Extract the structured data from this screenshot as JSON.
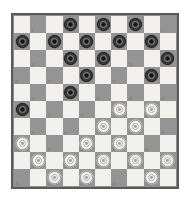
{
  "app": {
    "title": "Draughts Board",
    "board_type": "international-draughts-10x10"
  },
  "board": {
    "rows": 10,
    "columns": 10,
    "light_square_color": "#f2f1ed",
    "dark_square_color": "#949494",
    "border_color": "#5a5a5a",
    "background_color": "#ffffff",
    "dark_piece_color": "#3b3b3b",
    "light_piece_color": "#f7f6f2",
    "piece_style": "concentric-rings",
    "dark_piece_count": 15,
    "light_piece_count": 15,
    "square_numbering": "playable-dark-squares-1-to-50",
    "numbering_visible": true
  },
  "chart_data": {
    "type": "table",
    "squares": [
      [
        {
          "shade": "light",
          "piece": null,
          "num": null
        },
        {
          "shade": "dark",
          "piece": null,
          "num": "1"
        },
        {
          "shade": "light",
          "piece": null,
          "num": null
        },
        {
          "shade": "dark",
          "piece": "dark",
          "num": "2"
        },
        {
          "shade": "light",
          "piece": null,
          "num": null
        },
        {
          "shade": "dark",
          "piece": "dark",
          "num": "3"
        },
        {
          "shade": "light",
          "piece": null,
          "num": null
        },
        {
          "shade": "dark",
          "piece": "dark",
          "num": "4"
        },
        {
          "shade": "light",
          "piece": null,
          "num": null
        },
        {
          "shade": "dark",
          "piece": null,
          "num": "5"
        }
      ],
      [
        {
          "shade": "dark",
          "piece": "dark",
          "num": "6"
        },
        {
          "shade": "light",
          "piece": null,
          "num": null
        },
        {
          "shade": "dark",
          "piece": "dark",
          "num": "7"
        },
        {
          "shade": "light",
          "piece": null,
          "num": null
        },
        {
          "shade": "dark",
          "piece": "dark",
          "num": "8"
        },
        {
          "shade": "light",
          "piece": null,
          "num": null
        },
        {
          "shade": "dark",
          "piece": "dark",
          "num": "9"
        },
        {
          "shade": "light",
          "piece": null,
          "num": null
        },
        {
          "shade": "dark",
          "piece": "dark",
          "num": "10"
        },
        {
          "shade": "light",
          "piece": null,
          "num": null
        }
      ],
      [
        {
          "shade": "light",
          "piece": null,
          "num": null
        },
        {
          "shade": "dark",
          "piece": null,
          "num": "11"
        },
        {
          "shade": "light",
          "piece": null,
          "num": null
        },
        {
          "shade": "dark",
          "piece": "dark",
          "num": "12"
        },
        {
          "shade": "light",
          "piece": null,
          "num": null
        },
        {
          "shade": "dark",
          "piece": "dark",
          "num": "13"
        },
        {
          "shade": "light",
          "piece": null,
          "num": null
        },
        {
          "shade": "dark",
          "piece": null,
          "num": "14"
        },
        {
          "shade": "light",
          "piece": null,
          "num": null
        },
        {
          "shade": "dark",
          "piece": "dark",
          "num": "15"
        }
      ],
      [
        {
          "shade": "dark",
          "piece": null,
          "num": "16"
        },
        {
          "shade": "light",
          "piece": null,
          "num": null
        },
        {
          "shade": "dark",
          "piece": null,
          "num": "17"
        },
        {
          "shade": "light",
          "piece": null,
          "num": null
        },
        {
          "shade": "dark",
          "piece": "dark",
          "num": "18"
        },
        {
          "shade": "light",
          "piece": null,
          "num": null
        },
        {
          "shade": "dark",
          "piece": null,
          "num": "19"
        },
        {
          "shade": "light",
          "piece": null,
          "num": null
        },
        {
          "shade": "dark",
          "piece": "dark",
          "num": "20"
        },
        {
          "shade": "light",
          "piece": null,
          "num": null
        }
      ],
      [
        {
          "shade": "light",
          "piece": null,
          "num": null
        },
        {
          "shade": "dark",
          "piece": null,
          "num": "21"
        },
        {
          "shade": "light",
          "piece": null,
          "num": null
        },
        {
          "shade": "dark",
          "piece": "dark",
          "num": "22"
        },
        {
          "shade": "light",
          "piece": null,
          "num": null
        },
        {
          "shade": "dark",
          "piece": null,
          "num": "23"
        },
        {
          "shade": "light",
          "piece": null,
          "num": null
        },
        {
          "shade": "dark",
          "piece": null,
          "num": "24"
        },
        {
          "shade": "light",
          "piece": null,
          "num": null
        },
        {
          "shade": "dark",
          "piece": null,
          "num": "25"
        }
      ],
      [
        {
          "shade": "dark",
          "piece": "dark",
          "num": "26"
        },
        {
          "shade": "light",
          "piece": null,
          "num": null
        },
        {
          "shade": "dark",
          "piece": null,
          "num": "27"
        },
        {
          "shade": "light",
          "piece": null,
          "num": null
        },
        {
          "shade": "dark",
          "piece": null,
          "num": "28"
        },
        {
          "shade": "light",
          "piece": null,
          "num": null
        },
        {
          "shade": "dark",
          "piece": "light",
          "num": "29"
        },
        {
          "shade": "light",
          "piece": null,
          "num": null
        },
        {
          "shade": "dark",
          "piece": "light",
          "num": "30"
        },
        {
          "shade": "light",
          "piece": null,
          "num": null
        }
      ],
      [
        {
          "shade": "light",
          "piece": null,
          "num": null
        },
        {
          "shade": "dark",
          "piece": null,
          "num": "31"
        },
        {
          "shade": "light",
          "piece": null,
          "num": null
        },
        {
          "shade": "dark",
          "piece": null,
          "num": "32"
        },
        {
          "shade": "light",
          "piece": null,
          "num": null
        },
        {
          "shade": "dark",
          "piece": "light",
          "num": "33"
        },
        {
          "shade": "light",
          "piece": null,
          "num": null
        },
        {
          "shade": "dark",
          "piece": "light",
          "num": "34"
        },
        {
          "shade": "light",
          "piece": null,
          "num": null
        },
        {
          "shade": "dark",
          "piece": null,
          "num": "35"
        }
      ],
      [
        {
          "shade": "dark",
          "piece": "light",
          "num": "36"
        },
        {
          "shade": "light",
          "piece": null,
          "num": null
        },
        {
          "shade": "dark",
          "piece": null,
          "num": "37"
        },
        {
          "shade": "light",
          "piece": null,
          "num": null
        },
        {
          "shade": "dark",
          "piece": "light",
          "num": "38"
        },
        {
          "shade": "light",
          "piece": null,
          "num": null
        },
        {
          "shade": "dark",
          "piece": "light",
          "num": "39"
        },
        {
          "shade": "light",
          "piece": null,
          "num": null
        },
        {
          "shade": "dark",
          "piece": null,
          "num": "40"
        },
        {
          "shade": "light",
          "piece": null,
          "num": null
        }
      ],
      [
        {
          "shade": "light",
          "piece": null,
          "num": null
        },
        {
          "shade": "dark",
          "piece": "light",
          "num": "41"
        },
        {
          "shade": "light",
          "piece": null,
          "num": null
        },
        {
          "shade": "dark",
          "piece": "light",
          "num": "42"
        },
        {
          "shade": "light",
          "piece": null,
          "num": null
        },
        {
          "shade": "dark",
          "piece": "light",
          "num": "43"
        },
        {
          "shade": "light",
          "piece": null,
          "num": null
        },
        {
          "shade": "dark",
          "piece": "light",
          "num": "44"
        },
        {
          "shade": "light",
          "piece": null,
          "num": null
        },
        {
          "shade": "dark",
          "piece": "light",
          "num": "45"
        }
      ],
      [
        {
          "shade": "dark",
          "piece": null,
          "num": "46"
        },
        {
          "shade": "light",
          "piece": null,
          "num": null
        },
        {
          "shade": "dark",
          "piece": "light",
          "num": "47"
        },
        {
          "shade": "light",
          "piece": null,
          "num": null
        },
        {
          "shade": "dark",
          "piece": "light",
          "num": "48"
        },
        {
          "shade": "light",
          "piece": null,
          "num": null
        },
        {
          "shade": "dark",
          "piece": null,
          "num": "49"
        },
        {
          "shade": "light",
          "piece": null,
          "num": null
        },
        {
          "shade": "dark",
          "piece": "light",
          "num": "50"
        },
        {
          "shade": "light",
          "piece": null,
          "num": null
        }
      ]
    ]
  }
}
